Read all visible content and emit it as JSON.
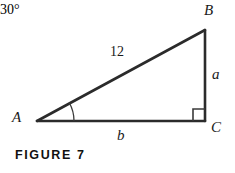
{
  "figure": {
    "caption": "FIGURE 7",
    "type": "right-triangle-diagram",
    "stroke_color": "#2b2b2b",
    "text_color": "#1a1a1a",
    "background_color": "#ffffff",
    "vertices": [
      {
        "name": "A",
        "label": "A",
        "x": 37,
        "y": 121
      },
      {
        "name": "B",
        "label": "B",
        "x": 205,
        "y": 30
      },
      {
        "name": "C",
        "label": "C",
        "x": 205,
        "y": 121
      }
    ],
    "sides": [
      {
        "name": "hypotenuse-AB",
        "label": "12"
      },
      {
        "name": "opposite-BC",
        "label": "a"
      },
      {
        "name": "adjacent-AC",
        "label": "b"
      }
    ],
    "angles": [
      {
        "at": "A",
        "label": "30°",
        "marker": "arc"
      },
      {
        "at": "C",
        "label": "",
        "marker": "right-angle-square"
      }
    ]
  }
}
